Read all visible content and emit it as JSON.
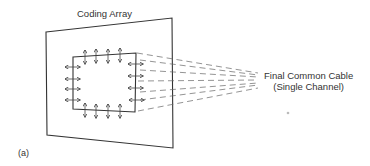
{
  "figure": {
    "title": "Coding Array",
    "cable_label_line1": "Final Common Cable",
    "cable_label_line2": "(Single Channel)",
    "panel_label": "(a)",
    "colors": {
      "stroke": "#333333",
      "dash": "#666666",
      "background": "#ffffff"
    }
  }
}
